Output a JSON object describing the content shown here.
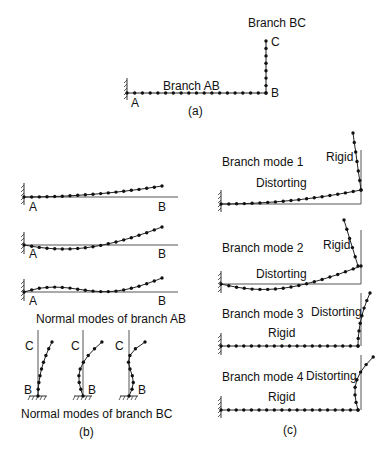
{
  "panel_a": {
    "caption": "(a)",
    "branch_bc_label": "Branch BC",
    "branch_ab_label": "Branch AB",
    "node_a": "A",
    "node_b": "B",
    "node_c": "C"
  },
  "panel_b": {
    "caption": "(b)",
    "ab_modes_caption": "Normal modes of branch AB",
    "bc_modes_caption": "Normal modes of branch BC",
    "node_a": "A",
    "node_b": "B",
    "node_c": "C"
  },
  "panel_c": {
    "caption": "(c)",
    "modes": [
      {
        "title": "Branch mode 1",
        "horizontal_label": "Distorting",
        "vertical_label": "Rigid"
      },
      {
        "title": "Branch mode 2",
        "horizontal_label": "Distorting",
        "vertical_label": "Rigid"
      },
      {
        "title": "Branch mode 3",
        "horizontal_label": "Rigid",
        "vertical_label": "Distorting"
      },
      {
        "title": "Branch mode 4",
        "horizontal_label": "Rigid",
        "vertical_label": "Distorting"
      }
    ]
  }
}
